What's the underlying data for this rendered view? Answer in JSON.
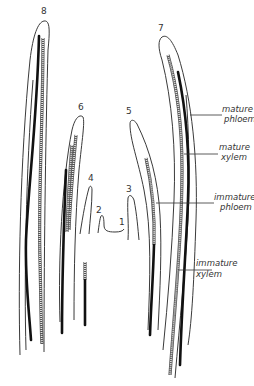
{
  "figure": {
    "title": "",
    "primordia_labels": [
      "1",
      "2",
      "3",
      "4",
      "5",
      "6",
      "7",
      "8"
    ],
    "annotations": {
      "mature_phloem": [
        "mature",
        "phloem"
      ],
      "mature_xylem": [
        "mature",
        "xylem"
      ],
      "immature_phloem": [
        "immature",
        "phloem"
      ],
      "immature_xylem": [
        "immature",
        "xylem"
      ]
    },
    "colors": {
      "outline": "#3a3a3a",
      "phloem": "#111111",
      "xylem": "#8a8a8a",
      "background": "#ffffff"
    }
  }
}
